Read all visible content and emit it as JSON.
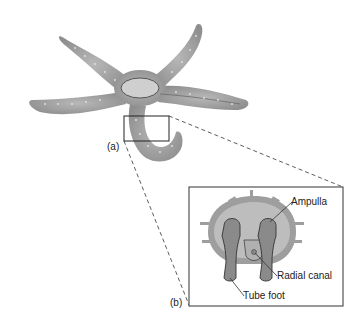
{
  "figure": {
    "panel_a_label": "(a)",
    "panel_b_label": "(b)",
    "callouts": {
      "ampulla": "Ampulla",
      "radial_canal": "Radial canal",
      "tube_foot": "Tube foot"
    },
    "colors": {
      "body_fill": "#9a9a9a",
      "body_light": "#c4c4c4",
      "tube_foot_dark": "#7c7c7c",
      "outline": "#333333"
    }
  }
}
